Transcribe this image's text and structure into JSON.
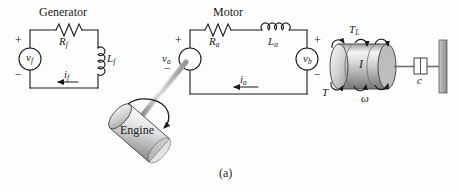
{
  "figure": {
    "caption": "(a)",
    "background": "#fdfdfd",
    "line_color": "#1a1a1a"
  },
  "generator": {
    "title": "Generator",
    "source": {
      "label": "v",
      "sub": "f",
      "plus": "+",
      "minus": "−"
    },
    "resistor": {
      "label": "R",
      "sub": "f"
    },
    "inductor": {
      "label": "L",
      "sub": "f"
    },
    "current": {
      "label": "i",
      "sub": "f",
      "direction": "left"
    }
  },
  "motor": {
    "title": "Motor",
    "armature_source": {
      "label": "v",
      "sub": "a",
      "plus": "+",
      "minus": "−"
    },
    "resistor": {
      "label": "R",
      "sub": "a"
    },
    "inductor": {
      "label": "L",
      "sub": "a"
    },
    "back_emf": {
      "label": "v",
      "sub": "b",
      "plus": "+",
      "minus": "−"
    },
    "current": {
      "label": "i",
      "sub": "a",
      "direction": "left"
    }
  },
  "engine": {
    "label": "Engine",
    "shaft": "drive-shaft",
    "rotation_arrow": "curved-rotation-arrow"
  },
  "load": {
    "inertia": {
      "label": "I"
    },
    "load_torque": {
      "label": "T",
      "sub": "L"
    },
    "motor_torque": {
      "label": "T"
    },
    "angular_velocity": {
      "label": "ω"
    },
    "damper": {
      "label": "c"
    },
    "ground": "fixed-wall"
  },
  "colors": {
    "cylinder_light": "#f2f2f2",
    "cylinder_mid": "#b9b9b9",
    "cylinder_dark": "#8c8c8c",
    "wall": "#b0b0b0",
    "stroke": "#1a1a1a"
  }
}
